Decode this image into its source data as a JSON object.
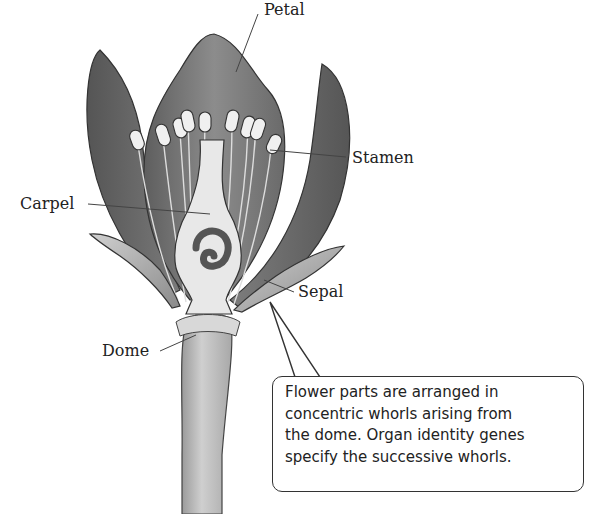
{
  "figure": {
    "labels": {
      "petal": "Petal",
      "stamen": "Stamen",
      "carpel": "Carpel",
      "sepal": "Sepal",
      "dome": "Dome"
    },
    "callout": {
      "lines": [
        "Flower parts are arranged in",
        "concentric whorls arising from",
        "the dome. Organ identity genes",
        "specify the successive whorls."
      ]
    },
    "colors": {
      "petal_dark": "#6e6e6e",
      "petal_mid": "#8a8a8a",
      "carpel_fill": "#e6e6e6",
      "stem_fill": "#c9c9c9",
      "outline": "#333333"
    }
  }
}
